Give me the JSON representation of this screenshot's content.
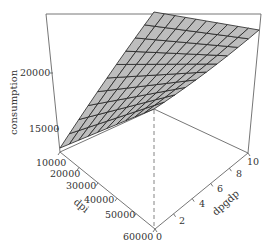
{
  "chart_data": {
    "type": "surface3d",
    "title": "",
    "xlabel": "dpi",
    "ylabel": "dpgdp",
    "zlabel": "consumption",
    "x_ticks": [
      "10000",
      "20000",
      "30000",
      "40000",
      "50000",
      "60000"
    ],
    "y_ticks": [
      "0",
      "2",
      "4",
      "6",
      "8",
      "10"
    ],
    "z_ticks": [
      "15000",
      "20000"
    ],
    "xlim": [
      10000,
      60000
    ],
    "ylim": [
      0,
      10
    ],
    "zlim": [
      12500,
      24000
    ],
    "grid_resolution": [
      10,
      10
    ],
    "surface_color": "#bdbdbd",
    "surface_line_color": "#222222",
    "box_color": "#555555",
    "corners": [
      {
        "dpi": 10000,
        "dpgdp": 0,
        "consumption": 13000
      },
      {
        "dpi": 60000,
        "dpgdp": 0,
        "consumption": 17500
      },
      {
        "dpi": 10000,
        "dpgdp": 10,
        "consumption": 23500
      },
      {
        "dpi": 60000,
        "dpgdp": 10,
        "consumption": 23000
      }
    ]
  },
  "labels": {
    "z_title": "consumption",
    "x_title": "dpi",
    "y_title": "dpgdp",
    "z_ticks": [
      "20000",
      "15000"
    ],
    "x_ticks": [
      "10000",
      "20000",
      "30000",
      "40000",
      "50000",
      "60000"
    ],
    "y_ticks": [
      "0",
      "2",
      "4",
      "6",
      "8",
      "10"
    ]
  }
}
